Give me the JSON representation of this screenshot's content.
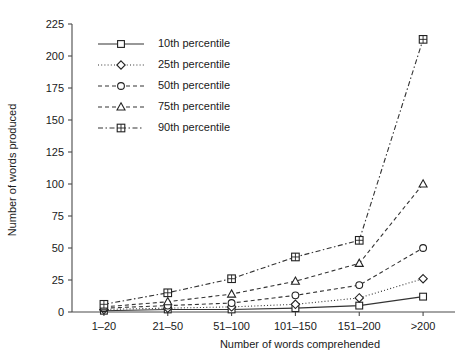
{
  "chart_data": {
    "type": "line",
    "title": "",
    "xlabel": "Number of words comprehended",
    "ylabel": "Number of words produced",
    "categories": [
      "1–20",
      "21–50",
      "51–100",
      "101–150",
      "151–200",
      ">200"
    ],
    "ylim": [
      0,
      225
    ],
    "yticks": [
      0,
      25,
      50,
      75,
      100,
      125,
      150,
      175,
      200,
      225
    ],
    "ytick_labels": [
      "0",
      "25",
      "50",
      "75",
      "100",
      "125",
      "150",
      "175",
      "200",
      "225"
    ],
    "grid": false,
    "legend_position": "top-left",
    "series": [
      {
        "name": "10th percentile",
        "values": [
          1,
          2,
          2,
          3,
          5,
          12
        ],
        "marker": "square",
        "linestyle": "solid"
      },
      {
        "name": "25th percentile",
        "values": [
          2,
          3,
          4,
          6,
          11,
          26
        ],
        "marker": "diamond",
        "linestyle": "dotted"
      },
      {
        "name": "50th percentile",
        "values": [
          3,
          5,
          7,
          13,
          21,
          50
        ],
        "marker": "circle",
        "linestyle": "dashed"
      },
      {
        "name": "75th percentile",
        "values": [
          4,
          8,
          14,
          24,
          38,
          100
        ],
        "marker": "triangle",
        "linestyle": "dashed"
      },
      {
        "name": "90th percentile",
        "values": [
          6,
          15,
          26,
          43,
          56,
          213
        ],
        "marker": "crossed-square",
        "linestyle": "dash-dot"
      }
    ],
    "colors": {
      "line": "#333333",
      "axis": "#4a4a4a",
      "text": "#1a1a1a",
      "background": "#ffffff",
      "marker_fill": "#ffffff"
    }
  }
}
